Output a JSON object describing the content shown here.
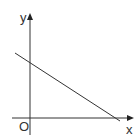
{
  "diagram": {
    "type": "coordinate-plane-line",
    "axes": {
      "x_label": "x",
      "y_label": "y",
      "origin_label": "O"
    },
    "line": {
      "description": "straight line with negative slope crossing positive y-axis and positive x-axis"
    },
    "colors": {
      "stroke": "#333333",
      "background": "#ffffff"
    }
  }
}
